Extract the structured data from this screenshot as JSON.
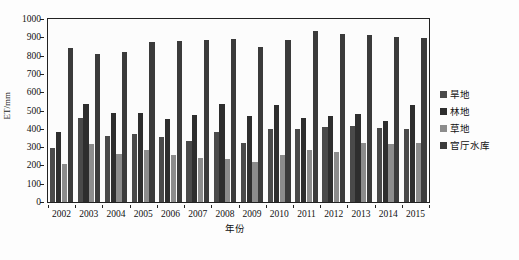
{
  "chart_data": {
    "type": "bar",
    "title": "",
    "xlabel": "年份",
    "ylabel": "ET/mm",
    "ylim": [
      0,
      1000
    ],
    "ytick_step": 100,
    "grid": false,
    "legend_position": "right",
    "categories": [
      "2002",
      "2003",
      "2004",
      "2005",
      "2006",
      "2007",
      "2008",
      "2009",
      "2010",
      "2011",
      "2012",
      "2013",
      "2014",
      "2015"
    ],
    "yticks": [
      "0",
      "100",
      "200",
      "300",
      "400",
      "500",
      "600",
      "700",
      "800",
      "900",
      "1000"
    ],
    "series": [
      {
        "name": "旱地",
        "color": "#4a4a4a",
        "values": [
          295,
          460,
          360,
          372,
          358,
          335,
          380,
          325,
          398,
          398,
          410,
          418,
          405,
          398
        ]
      },
      {
        "name": "林地",
        "color": "#2e2e2e",
        "values": [
          385,
          533,
          485,
          487,
          455,
          478,
          533,
          470,
          530,
          458,
          468,
          480,
          440,
          528
        ]
      },
      {
        "name": "草地",
        "color": "#8c8c8c",
        "values": [
          210,
          315,
          262,
          283,
          255,
          238,
          235,
          220,
          255,
          285,
          272,
          322,
          318,
          322
        ]
      },
      {
        "name": "官厅水库",
        "color": "#3b3b3b",
        "values": [
          840,
          808,
          822,
          875,
          878,
          886,
          893,
          848,
          885,
          932,
          920,
          912,
          900,
          898
        ]
      }
    ]
  },
  "legend": {
    "items": [
      {
        "label": "旱地"
      },
      {
        "label": "林地"
      },
      {
        "label": "草地"
      },
      {
        "label": "官厅水库"
      }
    ]
  }
}
